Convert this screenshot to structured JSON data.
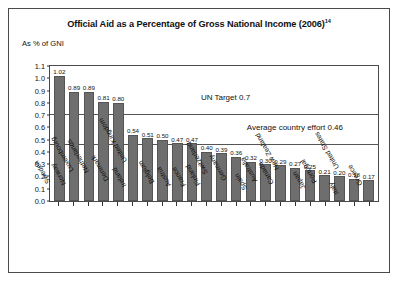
{
  "figure": {
    "title": "Official Aid as a Percentage of Gross National Income (2006)",
    "title_superscript": "14",
    "axis_note": "As % of GNI"
  },
  "chart_data": {
    "type": "bar",
    "title": "Official Aid as a Percentage of Gross National Income (2006)",
    "xlabel": "",
    "ylabel": "As % of GNI",
    "ylim": [
      0.0,
      1.1
    ],
    "grid": false,
    "legend": "none",
    "yticks": [
      "0.0",
      "0.1",
      "0.2",
      "0.3",
      "0.4",
      "0.5",
      "0.6",
      "0.7",
      "0.8",
      "0.9",
      "1.0",
      "1.1"
    ],
    "categories": [
      "Sweden",
      "Norway",
      "Luxembourg",
      "Netherlands",
      "Denmark",
      "Ireland",
      "United Kingdom",
      "Belgium",
      "Austria",
      "France",
      "Finland",
      "Switzerland",
      "Germany",
      "Spain",
      "Australia",
      "Canada",
      "New Zealand",
      "Japan",
      "Portugal",
      "Italy",
      "United States",
      "Greece"
    ],
    "values": [
      1.02,
      0.89,
      0.89,
      0.81,
      0.8,
      0.54,
      0.51,
      0.5,
      0.47,
      0.47,
      0.4,
      0.39,
      0.36,
      0.32,
      0.3,
      0.29,
      0.27,
      0.25,
      0.21,
      0.2,
      0.18,
      0.17
    ],
    "value_labels": [
      "1.02",
      "0.89",
      "0.89",
      "0.81",
      "0.80",
      "0.54",
      "0.51",
      "0.50",
      "0.47",
      "0.47",
      "0.40",
      "0.39",
      "0.36",
      "0.32",
      "0.30",
      "0.29",
      "0.27",
      "0.25",
      "0.21",
      "0.20",
      "0.18",
      "0.17"
    ],
    "annotations": [
      {
        "label": "UN Target 0.7",
        "value": 0.7
      },
      {
        "label": "Average country effort 0.46",
        "value": 0.46
      }
    ],
    "bar_color": "#6e6e6e",
    "reference_line_color": "#555555"
  }
}
